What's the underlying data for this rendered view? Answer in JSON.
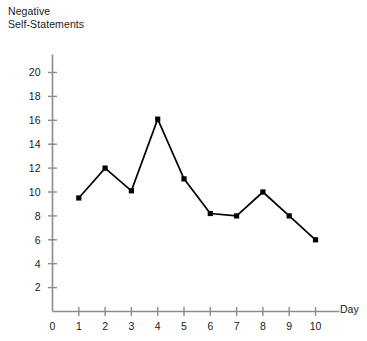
{
  "chart_data": {
    "type": "line",
    "title": "",
    "ylabel": "Negative\nSelf-Statements",
    "xlabel": "Day",
    "x": [
      1,
      2,
      3,
      4,
      5,
      6,
      7,
      8,
      9,
      10
    ],
    "values": [
      9.5,
      12.0,
      10.1,
      16.1,
      11.1,
      8.2,
      8.0,
      10.0,
      8.0,
      6.0
    ],
    "categories": [
      "1",
      "2",
      "3",
      "4",
      "5",
      "6",
      "7",
      "8",
      "9",
      "10"
    ],
    "xlim": [
      0,
      10
    ],
    "ylim": [
      0,
      21.5
    ],
    "xticks": [
      0,
      1,
      2,
      3,
      4,
      5,
      6,
      7,
      8,
      9,
      10
    ],
    "xtick_labels": [
      "0",
      "1",
      "2",
      "3",
      "4",
      "5",
      "6",
      "7",
      "8",
      "9",
      "10"
    ],
    "yticks": [
      2,
      4,
      6,
      8,
      10,
      12,
      14,
      16,
      18,
      20
    ],
    "ytick_labels": [
      "2",
      "4",
      "6",
      "8",
      "10",
      "12",
      "14",
      "16",
      "18",
      "20"
    ],
    "grid": false,
    "legend": null,
    "series": [
      {
        "name": "Negative Self-Statements",
        "values": [
          9.5,
          12.0,
          10.1,
          16.1,
          11.1,
          8.2,
          8.0,
          10.0,
          8.0,
          6.0
        ],
        "line_color": "#000000",
        "marker": "square",
        "marker_color": "#000000"
      }
    ],
    "colors": {
      "axis": "#8c8c8c",
      "line": "#000000",
      "marker": "#000000",
      "text": "#1a1a1a",
      "background": "#ffffff"
    }
  }
}
